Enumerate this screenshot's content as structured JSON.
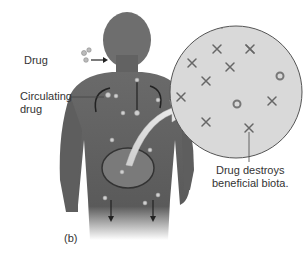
{
  "figure": {
    "panel_label": "(b)",
    "labels": {
      "drug": "Drug",
      "circulating_line1": "Circulating",
      "circulating_line2": "drug",
      "destroys_line1": "Drug destroys",
      "destroys_line2": "beneficial biota."
    },
    "colors": {
      "body": "#5c5c5c",
      "body_light": "#8a8a8a",
      "inset_fill": "#d9d9d9",
      "inset_border": "#555555",
      "marker": "#777777",
      "background": "#ffffff"
    }
  }
}
